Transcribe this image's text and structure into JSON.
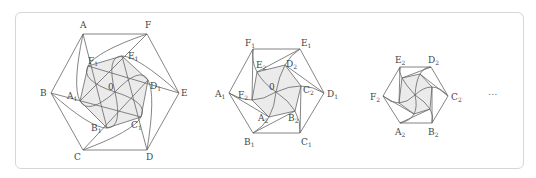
{
  "figure": {
    "frame": {
      "border_color": "#d6d6d6",
      "background": "#ffffff"
    },
    "colors": {
      "stroke": "#666666",
      "fill": "#ebebeb",
      "label": "#444444"
    },
    "center_label": "0",
    "ellipsis": "...",
    "stages": [
      {
        "name": "stage-1",
        "center": [
          115,
          92
        ],
        "outer": [
          {
            "label": "A",
            "sub": "",
            "x": 83,
            "y": 34,
            "lx": 80,
            "ly": 28
          },
          {
            "label": "B",
            "sub": "",
            "x": 51,
            "y": 93,
            "lx": 40,
            "ly": 96
          },
          {
            "label": "C",
            "sub": "",
            "x": 83,
            "y": 150,
            "lx": 74,
            "ly": 160
          },
          {
            "label": "D",
            "sub": "",
            "x": 147,
            "y": 150,
            "lx": 146,
            "ly": 160
          },
          {
            "label": "E",
            "sub": "",
            "x": 179,
            "y": 93,
            "lx": 181,
            "ly": 96
          },
          {
            "label": "F",
            "sub": "",
            "x": 147,
            "y": 34,
            "lx": 145,
            "ly": 28
          }
        ],
        "inner": [
          {
            "label": "A",
            "sub": "1",
            "x": 80,
            "y": 101,
            "lx": 67,
            "ly": 99
          },
          {
            "label": "B",
            "sub": "1",
            "x": 107,
            "y": 128,
            "lx": 91,
            "ly": 131
          },
          {
            "label": "C",
            "sub": "1",
            "x": 141,
            "y": 117,
            "lx": 131,
            "ly": 128
          },
          {
            "label": "D",
            "sub": "1",
            "x": 148,
            "y": 80,
            "lx": 150,
            "ly": 89
          },
          {
            "label": "E",
            "sub": "1",
            "x": 122,
            "y": 56,
            "lx": 128,
            "ly": 59
          },
          {
            "label": "F",
            "sub": "1",
            "x": 88,
            "y": 66,
            "lx": 88,
            "ly": 64
          }
        ]
      },
      {
        "name": "stage-2",
        "center": [
          276,
          92
        ],
        "outer": [
          {
            "label": "F",
            "sub": "1",
            "x": 253,
            "y": 49,
            "lx": 245,
            "ly": 46
          },
          {
            "label": "A",
            "sub": "1",
            "x": 229,
            "y": 93,
            "lx": 215,
            "ly": 97
          },
          {
            "label": "B",
            "sub": "1",
            "x": 253,
            "y": 133,
            "lx": 244,
            "ly": 145
          },
          {
            "label": "C",
            "sub": "1",
            "x": 300,
            "y": 133,
            "lx": 301,
            "ly": 145
          },
          {
            "label": "D",
            "sub": "1",
            "x": 324,
            "y": 93,
            "lx": 327,
            "ly": 97
          },
          {
            "label": "E",
            "sub": "1",
            "x": 300,
            "y": 49,
            "lx": 301,
            "ly": 46
          }
        ],
        "inner": [
          {
            "label": "E",
            "sub": "2",
            "x": 257,
            "y": 72,
            "lx": 256,
            "ly": 68
          },
          {
            "label": "F",
            "sub": "2",
            "x": 252,
            "y": 100,
            "lx": 238,
            "ly": 98
          },
          {
            "label": "A",
            "sub": "2",
            "x": 269,
            "y": 117,
            "lx": 258,
            "ly": 121
          },
          {
            "label": "B",
            "sub": "2",
            "x": 295,
            "y": 111,
            "lx": 288,
            "ly": 121
          },
          {
            "label": "C",
            "sub": "2",
            "x": 301,
            "y": 86,
            "lx": 303,
            "ly": 93
          },
          {
            "label": "D",
            "sub": "2",
            "x": 285,
            "y": 65,
            "lx": 286,
            "ly": 67
          }
        ]
      },
      {
        "name": "stage-3",
        "center": [
          415,
          95
        ],
        "outer": [
          {
            "label": "E",
            "sub": "2",
            "x": 400,
            "y": 67,
            "lx": 395,
            "ly": 63
          },
          {
            "label": "F",
            "sub": "2",
            "x": 383,
            "y": 96,
            "lx": 370,
            "ly": 100
          },
          {
            "label": "A",
            "sub": "2",
            "x": 400,
            "y": 123,
            "lx": 395,
            "ly": 135
          },
          {
            "label": "B",
            "sub": "2",
            "x": 432,
            "y": 123,
            "lx": 428,
            "ly": 135
          },
          {
            "label": "C",
            "sub": "2",
            "x": 448,
            "y": 96,
            "lx": 451,
            "ly": 100
          },
          {
            "label": "D",
            "sub": "2",
            "x": 431,
            "y": 67,
            "lx": 428,
            "ly": 63
          }
        ],
        "inner": [
          {
            "label": "",
            "sub": "",
            "x": 402,
            "y": 78,
            "lx": 0,
            "ly": 0
          },
          {
            "label": "",
            "sub": "",
            "x": 399,
            "y": 103,
            "lx": 0,
            "ly": 0
          },
          {
            "label": "",
            "sub": "",
            "x": 414,
            "y": 114,
            "lx": 0,
            "ly": 0
          },
          {
            "label": "",
            "sub": "",
            "x": 430,
            "y": 109,
            "lx": 0,
            "ly": 0
          },
          {
            "label": "",
            "sub": "",
            "x": 432,
            "y": 87,
            "lx": 0,
            "ly": 0
          },
          {
            "label": "",
            "sub": "",
            "x": 420,
            "y": 74,
            "lx": 0,
            "ly": 0
          }
        ]
      }
    ]
  }
}
